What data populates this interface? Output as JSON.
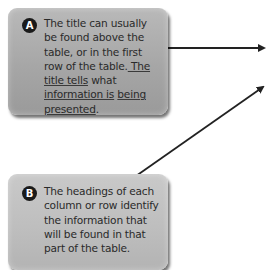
{
  "callouts": {
    "a": {
      "badge": "A",
      "text_plain": "The title can usually be found above the table, or in the first row of the table.",
      "text_underlined_1": " The title tells",
      "text_mid": " what ",
      "text_underlined_2": "information is",
      "text_underlined_3": "being presented",
      "text_end": "."
    },
    "b": {
      "badge": "B",
      "text": "The headings of each column or row identify the information that will be found in that part of the table."
    }
  },
  "arrows": [
    {
      "name": "arrow-from-a",
      "from": [
        168,
        48
      ],
      "to": [
        268,
        48
      ]
    },
    {
      "name": "arrow-from-b",
      "from": [
        136,
        176
      ],
      "to": [
        267,
        84
      ]
    }
  ],
  "colors": {
    "box_a": "#a6a6a6",
    "box_b": "#bdbdbd",
    "arrow": "#222222",
    "badge": "#1a1a1a"
  }
}
